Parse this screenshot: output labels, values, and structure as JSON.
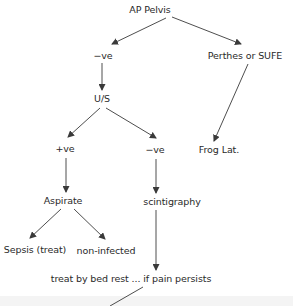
{
  "diagram": {
    "type": "flowchart",
    "nodes": {
      "ap_pelvis": "AP Pelvis",
      "neg1": "−ve",
      "perthes": "Perthes or SUFE",
      "us": "U/S",
      "frog": "Frog Lat.",
      "pos": "+ve",
      "neg2": "−ve",
      "aspirate": "Aspirate",
      "scint": "scintigraphy",
      "sepsis": "Sepsis (treat)",
      "noninf": "non-infected",
      "bedrest": "treat by bed rest ... if pain persists"
    },
    "edges": [
      [
        "ap_pelvis",
        "neg1"
      ],
      [
        "ap_pelvis",
        "perthes"
      ],
      [
        "neg1",
        "us"
      ],
      [
        "perthes",
        "frog"
      ],
      [
        "us",
        "pos"
      ],
      [
        "us",
        "neg2"
      ],
      [
        "pos",
        "aspirate"
      ],
      [
        "neg2",
        "scint"
      ],
      [
        "aspirate",
        "sepsis"
      ],
      [
        "aspirate",
        "noninf"
      ],
      [
        "scint",
        "bedrest"
      ],
      [
        "bedrest",
        "(continues)"
      ]
    ],
    "colors": {
      "line": "#3a3a3a",
      "text": "#2a2a2a",
      "band": "#f4f4f4"
    }
  }
}
